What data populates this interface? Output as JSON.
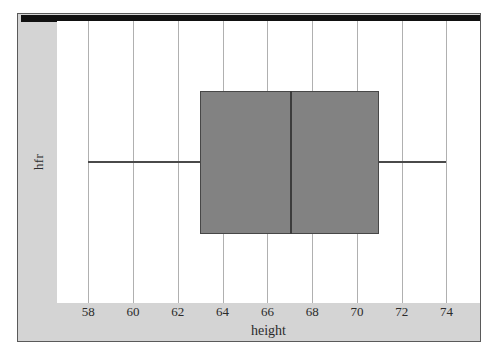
{
  "chart_data": {
    "type": "box",
    "title": "",
    "xlabel": "height",
    "ylabel": "hfr",
    "orientation": "horizontal",
    "xlim": [
      56.6,
      75.5
    ],
    "xticks": [
      58,
      60,
      62,
      64,
      66,
      68,
      70,
      72,
      74
    ],
    "xticklabels": [
      "58",
      "60",
      "62",
      "64",
      "66",
      "68",
      "70",
      "72",
      "74"
    ],
    "grid": "vertical",
    "legend": "none",
    "categories": [
      "hfr"
    ],
    "boxes": [
      {
        "label": "hfr",
        "whisker_low": 58.0,
        "q1": 63.0,
        "median": 67.0,
        "q3": 71.0,
        "whisker_high": 74.0,
        "outliers": []
      }
    ],
    "colors": {
      "box_fill": "#828282",
      "box_edge": "#474747",
      "median": "#3c3c3c",
      "whisker": "#4a4a4a",
      "gridline": "#b0b0b0",
      "panel_background": "#ffffff",
      "figure_background": "#d4d4d4",
      "top_rule": "#111111"
    }
  }
}
